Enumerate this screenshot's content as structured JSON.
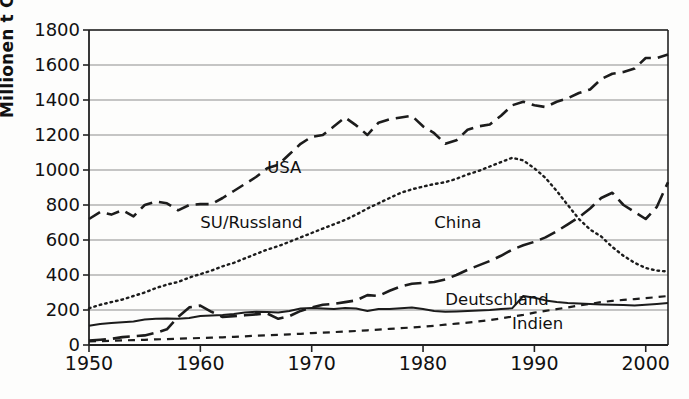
{
  "chart_data": {
    "type": "line",
    "title": "",
    "xlabel": "",
    "ylabel": "Millionen t C",
    "xlim": [
      1950,
      2002
    ],
    "ylim": [
      0,
      1800
    ],
    "grid": true,
    "legend_position": "inline-annotations",
    "x_ticks": [
      1950,
      1960,
      1970,
      1980,
      1990,
      2000
    ],
    "y_ticks": [
      0,
      200,
      400,
      600,
      800,
      1000,
      1200,
      1400,
      1600,
      1800
    ],
    "x": [
      1950,
      1951,
      1952,
      1953,
      1954,
      1955,
      1956,
      1957,
      1958,
      1959,
      1960,
      1961,
      1962,
      1963,
      1964,
      1965,
      1966,
      1967,
      1968,
      1969,
      1970,
      1971,
      1972,
      1973,
      1974,
      1975,
      1976,
      1977,
      1978,
      1979,
      1980,
      1981,
      1982,
      1983,
      1984,
      1985,
      1986,
      1987,
      1988,
      1989,
      1990,
      1991,
      1992,
      1993,
      1994,
      1995,
      1996,
      1997,
      1998,
      1999,
      2000,
      2001,
      2002
    ],
    "series": [
      {
        "name": "USA",
        "style": "dashed",
        "label_x": 1966,
        "label_y": 1010,
        "values": [
          720,
          760,
          745,
          770,
          735,
          800,
          820,
          810,
          770,
          800,
          805,
          805,
          840,
          880,
          920,
          960,
          1010,
          1030,
          1090,
          1150,
          1190,
          1200,
          1250,
          1300,
          1255,
          1200,
          1270,
          1290,
          1300,
          1310,
          1250,
          1210,
          1150,
          1170,
          1230,
          1250,
          1260,
          1310,
          1370,
          1390,
          1370,
          1360,
          1390,
          1410,
          1440,
          1460,
          1520,
          1550,
          1560,
          1580,
          1640,
          1640,
          1660
        ]
      },
      {
        "name": "SU/Russland",
        "style": "dotted",
        "label_x": 1960,
        "label_y": 700,
        "values": [
          210,
          230,
          245,
          260,
          280,
          300,
          325,
          345,
          360,
          385,
          405,
          425,
          450,
          470,
          495,
          520,
          545,
          565,
          590,
          615,
          640,
          665,
          690,
          715,
          745,
          780,
          810,
          840,
          870,
          890,
          905,
          920,
          930,
          950,
          975,
          995,
          1020,
          1045,
          1070,
          1055,
          1010,
          955,
          880,
          800,
          720,
          660,
          620,
          560,
          510,
          470,
          440,
          425,
          420
        ]
      },
      {
        "name": "China",
        "style": "longdash",
        "label_x": 1981,
        "label_y": 700,
        "values": [
          25,
          30,
          35,
          45,
          50,
          55,
          70,
          90,
          160,
          215,
          225,
          190,
          160,
          165,
          170,
          175,
          180,
          150,
          165,
          195,
          215,
          230,
          235,
          245,
          255,
          285,
          280,
          310,
          335,
          350,
          355,
          360,
          375,
          400,
          430,
          455,
          480,
          510,
          545,
          570,
          590,
          615,
          650,
          690,
          730,
          780,
          840,
          870,
          800,
          760,
          720,
          790,
          930
        ]
      },
      {
        "name": "Deutschland",
        "style": "solid",
        "label_x": 1982,
        "label_y": 255,
        "values": [
          110,
          120,
          125,
          130,
          135,
          145,
          150,
          152,
          150,
          155,
          165,
          168,
          172,
          178,
          185,
          190,
          188,
          185,
          195,
          208,
          212,
          208,
          205,
          212,
          208,
          195,
          205,
          205,
          210,
          215,
          205,
          195,
          190,
          192,
          195,
          198,
          200,
          205,
          210,
          280,
          270,
          255,
          245,
          240,
          238,
          235,
          232,
          230,
          228,
          225,
          230,
          235,
          240
        ]
      },
      {
        "name": "Indien",
        "style": "shortdash",
        "label_x": 1988,
        "label_y": 120,
        "values": [
          20,
          22,
          24,
          26,
          28,
          30,
          32,
          34,
          36,
          38,
          40,
          42,
          44,
          47,
          50,
          53,
          56,
          58,
          61,
          64,
          68,
          71,
          74,
          77,
          80,
          84,
          88,
          92,
          96,
          100,
          105,
          110,
          116,
          122,
          128,
          135,
          143,
          152,
          162,
          172,
          185,
          195,
          205,
          215,
          225,
          235,
          245,
          252,
          258,
          262,
          268,
          274,
          280
        ]
      }
    ]
  }
}
